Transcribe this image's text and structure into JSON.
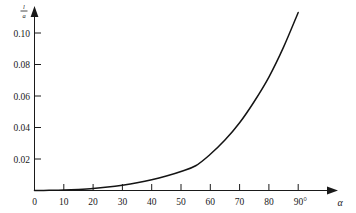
{
  "chart_data": {
    "type": "line",
    "title": "",
    "subtitle": "",
    "xlabel": "α",
    "ylabel": "l/a",
    "ylabel_numerator": "l",
    "ylabel_denominator": "a",
    "xlim": [
      0,
      95
    ],
    "ylim": [
      0,
      0.115
    ],
    "grid": false,
    "legend": null,
    "x_unit": "degrees",
    "x_tick_labels": [
      "0",
      "10",
      "20",
      "30",
      "40",
      "50",
      "60",
      "70",
      "80",
      "90°"
    ],
    "x_ticks": [
      0,
      10,
      20,
      30,
      40,
      50,
      60,
      70,
      80,
      90
    ],
    "y_tick_labels": [
      "0.02",
      "0.04",
      "0.06",
      "0.08",
      "0.10"
    ],
    "y_ticks": [
      0.02,
      0.04,
      0.06,
      0.08,
      0.1
    ],
    "origin_label": "0",
    "series": [
      {
        "name": "l/a vs alpha",
        "x": [
          0,
          5,
          10,
          15,
          20,
          25,
          30,
          35,
          40,
          45,
          50,
          55,
          60,
          65,
          70,
          75,
          80,
          85,
          90
        ],
        "values": [
          0.0,
          0.0001,
          0.0003,
          0.0007,
          0.0013,
          0.0022,
          0.0034,
          0.0049,
          0.0068,
          0.0092,
          0.0121,
          0.0157,
          0.023,
          0.032,
          0.043,
          0.0565,
          0.072,
          0.091,
          0.113
        ]
      }
    ],
    "colors": {
      "curve": "#141414",
      "axis": "#1a1a1a",
      "background": "#ffffff"
    }
  }
}
